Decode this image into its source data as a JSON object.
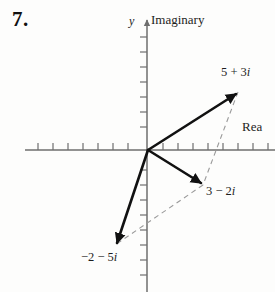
{
  "figure": {
    "problem_number": "7.",
    "axis_label_y": "y",
    "axis_label_imaginary": "Imaginary",
    "axis_label_real": "Rea",
    "label_z1": "5 + 3i",
    "label_z2": "3 − 2i",
    "label_z3": "−2 − 5i",
    "colors": {
      "background": "#fdfdfc",
      "axis": "#6e6e6e",
      "vector": "#111111",
      "dashed": "#9a9a9a",
      "text": "#1a1a1a"
    }
  },
  "chart_data": {
    "type": "scatter",
    "title": "",
    "xlabel": "Rea",
    "ylabel": "Imaginary",
    "grid": false,
    "legend": null,
    "axis_origin_px": [
      148,
      150
    ],
    "unit_px": 15,
    "xlim": [
      -7.3,
      8.5
    ],
    "ylim": [
      -9.5,
      8.9
    ],
    "x_ticks": [
      -7,
      -6,
      -5,
      -4,
      -3,
      -2,
      -1,
      1,
      2,
      3,
      4,
      5,
      6,
      7
    ],
    "y_ticks": [
      -8,
      -7,
      -6,
      -5,
      -4,
      -3,
      -2,
      -1,
      1,
      2,
      3,
      4,
      5,
      6,
      7
    ],
    "vectors": [
      {
        "name": "z1",
        "label": "5 + 3i",
        "real": 5,
        "imaginary": 3,
        "from": [
          0,
          0
        ],
        "to": [
          6.0,
          3.87
        ],
        "style": "solid-arrow"
      },
      {
        "name": "z2",
        "label": "3 − 2i",
        "real": 3,
        "imaginary": -2,
        "from": [
          0,
          0
        ],
        "to": [
          3.67,
          -2.33
        ],
        "style": "solid-arrow"
      },
      {
        "name": "z3",
        "label": "−2 − 5i",
        "real": -2,
        "imaginary": -5,
        "from": [
          0,
          0
        ],
        "to": [
          -2.2,
          -6.33
        ],
        "style": "solid-arrow"
      }
    ],
    "construction_lines": [
      {
        "name": "dashed-z1-to-z2",
        "from": [
          6.0,
          3.87
        ],
        "to": [
          3.67,
          -2.33
        ],
        "style": "dashed"
      },
      {
        "name": "dashed-z2-to-z3",
        "from": [
          3.67,
          -2.33
        ],
        "to": [
          -2.2,
          -6.33
        ],
        "style": "dashed"
      }
    ]
  }
}
